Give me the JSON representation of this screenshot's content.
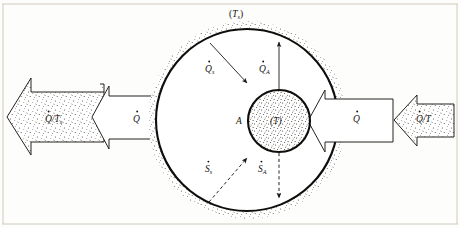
{
  "figure": {
    "kind": "thermodynamics-control-volume-diagram",
    "background_color": "#fdfdfb",
    "ink_color": "#100e0c"
  },
  "labels": {
    "surroundings_temperature": "(T",
    "surroundings_temperature_sub": "s",
    "surroundings_temperature_close": ")",
    "system_temperature": "(T)",
    "boundary_marker": "A",
    "heat_surroundings": "Q",
    "heat_surroundings_sub": "s",
    "heat_boundary": "Q",
    "heat_boundary_sub": "A",
    "entropy_surroundings": "S",
    "entropy_surroundings_sub": "s",
    "entropy_boundary": "S",
    "entropy_boundary_sub": "A",
    "heat_left_plain": "Q",
    "heat_right_plain": "Q",
    "entropy_flux_left": "Q/T",
    "entropy_flux_left_sub": "s",
    "entropy_flux_right": "Q/T"
  },
  "arrows": {
    "left_outer": {
      "name": "entropy-out-arrow",
      "label": "Q/T",
      "sub": "s",
      "fill": "stipple",
      "direction": "left"
    },
    "left_inner": {
      "name": "heat-out-arrow",
      "label": "Q",
      "fill": "white",
      "direction": "left"
    },
    "right_inner": {
      "name": "heat-in-arrow",
      "label": "Q",
      "fill": "white",
      "direction": "left"
    },
    "right_outer": {
      "name": "entropy-in-arrow",
      "label": "Q/T",
      "fill": "stipple",
      "direction": "left"
    }
  },
  "circles": {
    "outer": {
      "name": "surroundings-boundary",
      "cx": 247,
      "cy": 120,
      "r": 91,
      "fill": "white",
      "halo": "stipple"
    },
    "inner": {
      "name": "system-boundary",
      "cx": 279,
      "cy": 121,
      "r": 31,
      "fill": "stipple"
    }
  }
}
